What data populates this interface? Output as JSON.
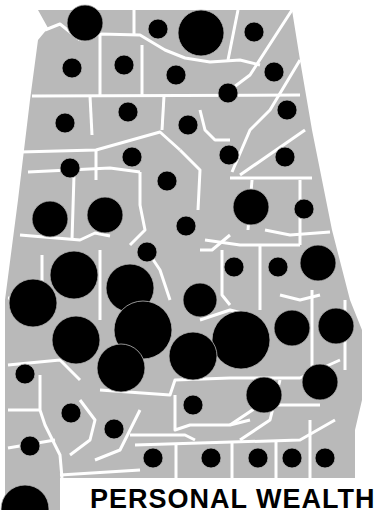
{
  "map": {
    "subject": "Alabama counties",
    "title": "PERSONAL WEALTH",
    "colors": {
      "land": "#b9b9b9",
      "border": "#ffffff",
      "symbol": "#000000",
      "background": "#ffffff"
    }
  },
  "chart_data": {
    "type": "proportional-symbol-map",
    "title": "PERSONAL WEALTH",
    "region": "Alabama (by county)",
    "symbols": [
      {
        "x": 85,
        "y": 23,
        "r": 18
      },
      {
        "x": 158,
        "y": 29,
        "r": 10
      },
      {
        "x": 201,
        "y": 33,
        "r": 23
      },
      {
        "x": 254,
        "y": 32,
        "r": 10
      },
      {
        "x": 72,
        "y": 68,
        "r": 10
      },
      {
        "x": 124,
        "y": 65,
        "r": 10
      },
      {
        "x": 176,
        "y": 75,
        "r": 10
      },
      {
        "x": 274,
        "y": 72,
        "r": 10
      },
      {
        "x": 228,
        "y": 93,
        "r": 10
      },
      {
        "x": 65,
        "y": 123,
        "r": 10
      },
      {
        "x": 128,
        "y": 112,
        "r": 10
      },
      {
        "x": 188,
        "y": 125,
        "r": 10
      },
      {
        "x": 287,
        "y": 110,
        "r": 10
      },
      {
        "x": 70,
        "y": 168,
        "r": 10
      },
      {
        "x": 132,
        "y": 157,
        "r": 10
      },
      {
        "x": 229,
        "y": 155,
        "r": 10
      },
      {
        "x": 285,
        "y": 157,
        "r": 10
      },
      {
        "x": 167,
        "y": 181,
        "r": 10
      },
      {
        "x": 50,
        "y": 219,
        "r": 18
      },
      {
        "x": 105,
        "y": 215,
        "r": 18
      },
      {
        "x": 186,
        "y": 226,
        "r": 10
      },
      {
        "x": 251,
        "y": 207,
        "r": 18
      },
      {
        "x": 304,
        "y": 209,
        "r": 10
      },
      {
        "x": 147,
        "y": 252,
        "r": 10
      },
      {
        "x": 74,
        "y": 275,
        "r": 24
      },
      {
        "x": 234,
        "y": 267,
        "r": 10
      },
      {
        "x": 278,
        "y": 267,
        "r": 10
      },
      {
        "x": 318,
        "y": 263,
        "r": 18
      },
      {
        "x": 33,
        "y": 303,
        "r": 24
      },
      {
        "x": 130,
        "y": 288,
        "r": 24
      },
      {
        "x": 200,
        "y": 300,
        "r": 17
      },
      {
        "x": 76,
        "y": 340,
        "r": 24
      },
      {
        "x": 143,
        "y": 330,
        "r": 29
      },
      {
        "x": 241,
        "y": 340,
        "r": 29
      },
      {
        "x": 292,
        "y": 328,
        "r": 18
      },
      {
        "x": 336,
        "y": 326,
        "r": 18
      },
      {
        "x": 193,
        "y": 356,
        "r": 24
      },
      {
        "x": 121,
        "y": 368,
        "r": 24
      },
      {
        "x": 25,
        "y": 374,
        "r": 10
      },
      {
        "x": 320,
        "y": 382,
        "r": 18
      },
      {
        "x": 264,
        "y": 395,
        "r": 18
      },
      {
        "x": 71,
        "y": 413,
        "r": 10
      },
      {
        "x": 193,
        "y": 405,
        "r": 10
      },
      {
        "x": 114,
        "y": 429,
        "r": 10
      },
      {
        "x": 30,
        "y": 446,
        "r": 10
      },
      {
        "x": 153,
        "y": 458,
        "r": 10
      },
      {
        "x": 211,
        "y": 458,
        "r": 10
      },
      {
        "x": 258,
        "y": 458,
        "r": 10
      },
      {
        "x": 292,
        "y": 458,
        "r": 10
      },
      {
        "x": 325,
        "y": 458,
        "r": 10
      },
      {
        "x": 25,
        "y": 509,
        "r": 24
      }
    ]
  }
}
